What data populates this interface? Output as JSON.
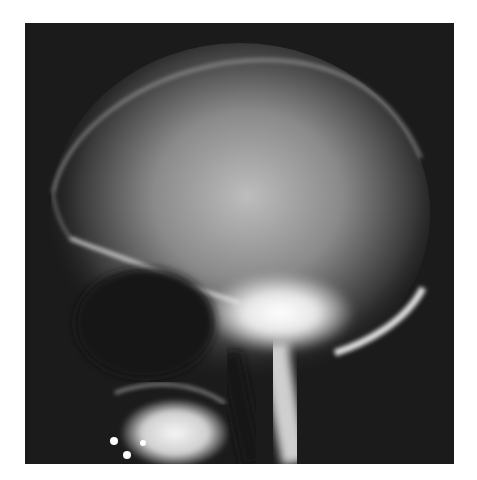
{
  "image": {
    "alt": "Lateral skull X-ray radiograph",
    "subject": "lateral skull radiograph",
    "colors": {
      "background": "#1b1b1b",
      "bone": "#f2f2f2",
      "page": "#ffffff"
    }
  }
}
